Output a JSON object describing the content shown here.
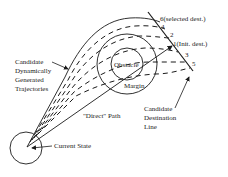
{
  "diagram": {
    "labels": {
      "candidate_trajectories": [
        "Candidate",
        "Dynamically",
        "Generated",
        "Trajectories"
      ],
      "obstacle": "Obstacle",
      "margin": "Margin",
      "direct_path": "\"Direct\" Path",
      "current_state": "Current State",
      "candidate_destination_line": [
        "Candidate",
        "Destination",
        "Line"
      ]
    },
    "destinations": [
      {
        "id": "6",
        "label": "6(selected dest.)"
      },
      {
        "id": "4",
        "label": "4"
      },
      {
        "id": "2",
        "label": "2"
      },
      {
        "id": "1",
        "label": "1(Init. dest.)"
      },
      {
        "id": "3",
        "label": "3"
      },
      {
        "id": "5",
        "label": "5"
      }
    ],
    "colors": {
      "ink": "#1a1a1a",
      "background": "#ffffff"
    }
  }
}
